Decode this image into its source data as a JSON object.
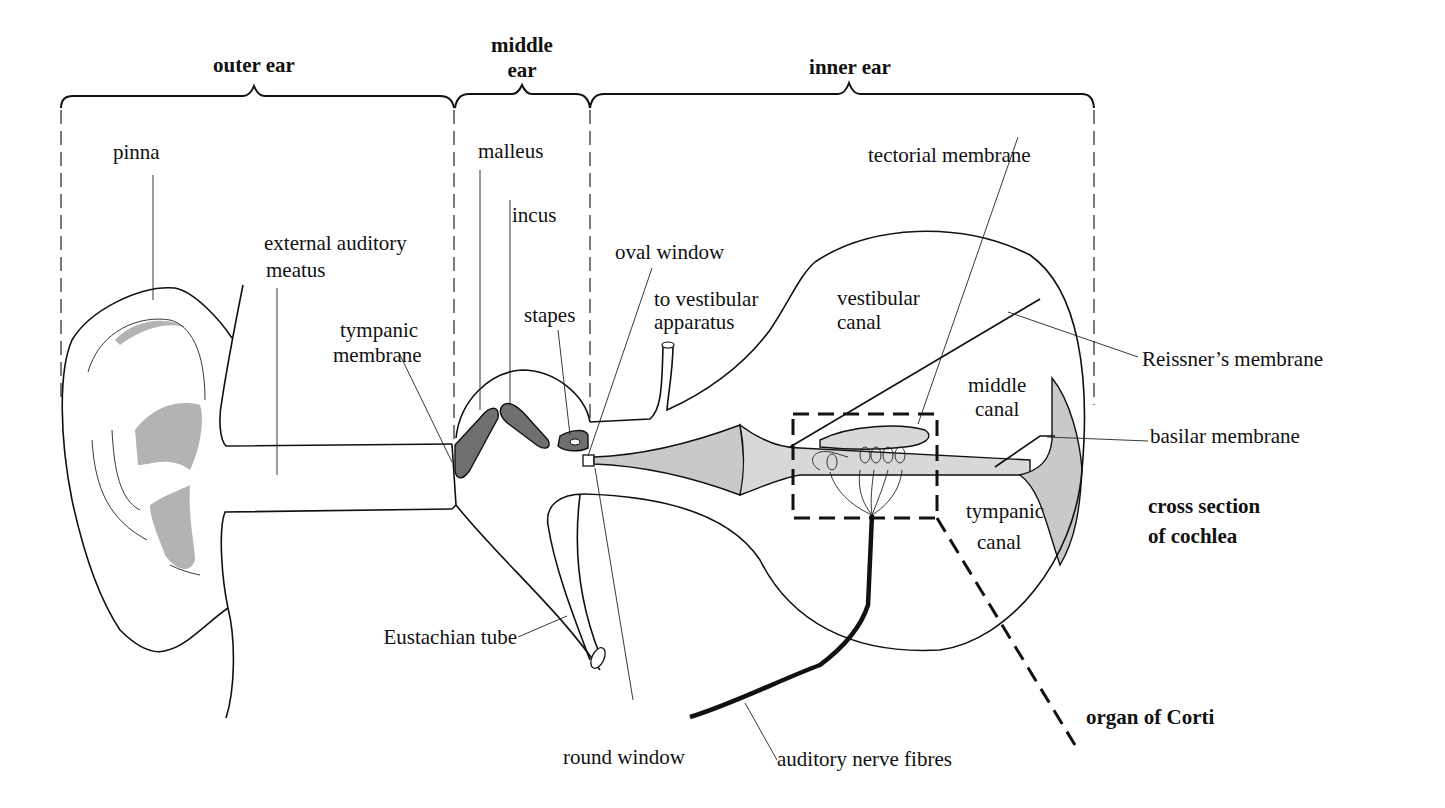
{
  "diagram": {
    "sections": [
      {
        "id": "outer",
        "label": "outer ear"
      },
      {
        "id": "middle",
        "label_line1": "middle",
        "label_line2": "ear"
      },
      {
        "id": "inner",
        "label": "inner ear"
      }
    ],
    "labels": {
      "pinna": "pinna",
      "external_auditory_line1": "external auditory",
      "external_auditory_line2": "meatus",
      "tympanic_membrane_line1": "tympanic",
      "tympanic_membrane_line2": "membrane",
      "malleus": "malleus",
      "incus": "incus",
      "stapes": "stapes",
      "oval_window": "oval window",
      "to_vestibular_line1": "to vestibular",
      "to_vestibular_line2": "apparatus",
      "eustachian_tube": "Eustachian tube",
      "round_window": "round window",
      "auditory_nerve": "auditory nerve fibres",
      "tectorial_membrane": "tectorial membrane",
      "vestibular_canal_line1": "vestibular",
      "vestibular_canal_line2": "canal",
      "middle_canal_line1": "middle",
      "middle_canal_line2": "canal",
      "tympanic_canal_line1": "tympanic",
      "tympanic_canal_line2": "canal",
      "reissners_membrane": "Reissner’s membrane",
      "basilar_membrane": "basilar membrane",
      "cross_section_line1": "cross section",
      "cross_section_line2": "of cochlea",
      "organ_of_corti": "organ of  Corti"
    },
    "colors": {
      "ink": "#111111",
      "light_shade": "#c9c9c9",
      "dark_shade": "#6f6f6f",
      "background": "#ffffff"
    }
  }
}
